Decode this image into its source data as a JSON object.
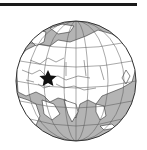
{
  "map": {
    "type": "orthographic-locator-globe",
    "region_shown": "Eurasia, Africa (north-east), Indian Ocean",
    "marker": {
      "shape": "star",
      "location": "Caucasus region"
    },
    "colors": {
      "ocean": "#b4b4b4",
      "land": "#ffffff",
      "borders": "#333333",
      "graticule": "#555555",
      "marker": "#111111",
      "top_rule": "#1a1a1a"
    }
  }
}
